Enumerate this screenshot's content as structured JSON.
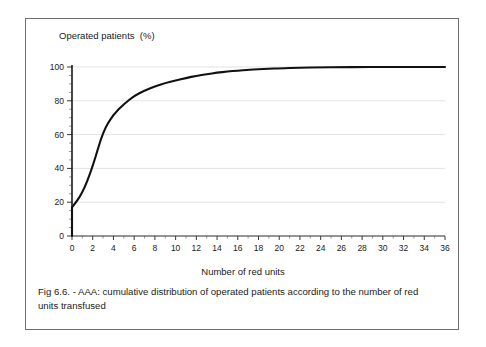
{
  "figure": {
    "caption": "Fig 6.6. - AAA: cumulative distribution of operated patients according to the number of red units transfused"
  },
  "chart_data": {
    "type": "line",
    "title": "",
    "ylabel": "Operated patients  (%)",
    "xlabel": "Number of red units",
    "xlim": [
      0,
      36
    ],
    "ylim": [
      0,
      100
    ],
    "xticks": [
      0,
      2,
      4,
      6,
      8,
      10,
      12,
      14,
      16,
      18,
      20,
      22,
      24,
      26,
      28,
      30,
      32,
      34,
      36
    ],
    "yticks": [
      0,
      20,
      40,
      60,
      80,
      100
    ],
    "y_minor_tick_step": 5,
    "grid": "horizontal",
    "legend": "none",
    "line_color": "#111111",
    "grid_color": "#e3e3e3",
    "axis_color": "#3a3a3a",
    "series": [
      {
        "name": "Cumulative % of operated patients",
        "x": [
          0,
          0,
          1,
          2,
          3,
          4,
          5,
          6,
          7,
          8,
          9,
          10,
          11,
          12,
          13,
          14,
          15,
          16,
          17,
          18,
          19,
          20,
          22,
          24,
          26,
          28,
          30,
          32,
          34,
          36
        ],
        "values": [
          0,
          17,
          25,
          41,
          62,
          72,
          78,
          83,
          86,
          88.5,
          90.5,
          92,
          93.5,
          94.8,
          95.8,
          96.6,
          97.3,
          97.9,
          98.3,
          98.7,
          99,
          99.3,
          99.6,
          99.8,
          99.9,
          100,
          100,
          100,
          100,
          100
        ]
      }
    ]
  }
}
